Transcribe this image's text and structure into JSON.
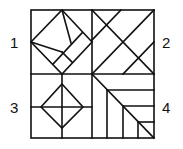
{
  "figure": {
    "colors": {
      "stroke": "#111111",
      "background": "#ffffff"
    },
    "labels": [
      {
        "id": "q1",
        "text": "1",
        "x": 14,
        "y": 47
      },
      {
        "id": "q2",
        "text": "2",
        "x": 165,
        "y": 47
      },
      {
        "id": "q3",
        "text": "3",
        "x": 14,
        "y": 112
      },
      {
        "id": "q4",
        "text": "4",
        "x": 165,
        "y": 112
      }
    ]
  }
}
